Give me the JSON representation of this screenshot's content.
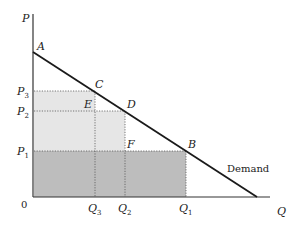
{
  "axes": {
    "y_label": "P",
    "x_label": "Q",
    "origin_label": "0"
  },
  "points": {
    "A": "A",
    "B": "B",
    "C": "C",
    "D": "D",
    "E": "E",
    "F": "F"
  },
  "price_ticks": [
    {
      "base": "P",
      "sub": "3"
    },
    {
      "base": "P",
      "sub": "2"
    },
    {
      "base": "P",
      "sub": "1"
    }
  ],
  "quantity_ticks": [
    {
      "base": "Q",
      "sub": "3"
    },
    {
      "base": "Q",
      "sub": "2"
    },
    {
      "base": "Q",
      "sub": "1"
    }
  ],
  "curve_label": "Demand",
  "colors": {
    "light_fill": "#e4e4e4",
    "dark_fill": "#bdbdbd",
    "line": "#1a1a1a"
  }
}
